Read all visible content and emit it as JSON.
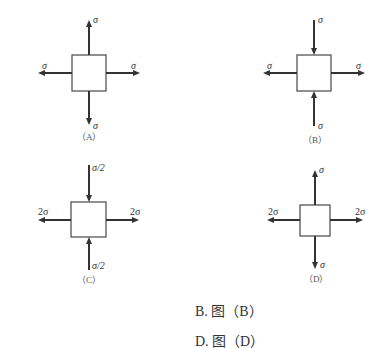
{
  "figures": [
    {
      "id": "A",
      "caption": "（A）",
      "labels": {
        "top": "σ",
        "bottom": "σ",
        "left": "σ",
        "right": "σ"
      },
      "arrows": {
        "vertical": "tension",
        "horizontal": "tension"
      }
    },
    {
      "id": "B",
      "caption": "（B）",
      "labels": {
        "top": "σ",
        "bottom": "σ",
        "left": "σ",
        "right": "σ"
      },
      "arrows": {
        "vertical": "compression",
        "horizontal": "tension"
      }
    },
    {
      "id": "C",
      "caption": "（C）",
      "labels": {
        "top": "σ/2",
        "bottom": "σ/2",
        "left": "2σ",
        "right": "2σ"
      },
      "arrows": {
        "vertical": "compression",
        "horizontal": "tension"
      }
    },
    {
      "id": "D",
      "caption": "（D）",
      "labels": {
        "top": "σ",
        "bottom": "σ",
        "left": "2σ",
        "right": "2σ"
      },
      "arrows": {
        "vertical": "tension",
        "horizontal": "tension"
      }
    }
  ],
  "options": [
    {
      "label": "B. 图（B）"
    },
    {
      "label": "D. 图（D）"
    }
  ],
  "colors": {
    "line": "#333333",
    "box": "#555555"
  }
}
